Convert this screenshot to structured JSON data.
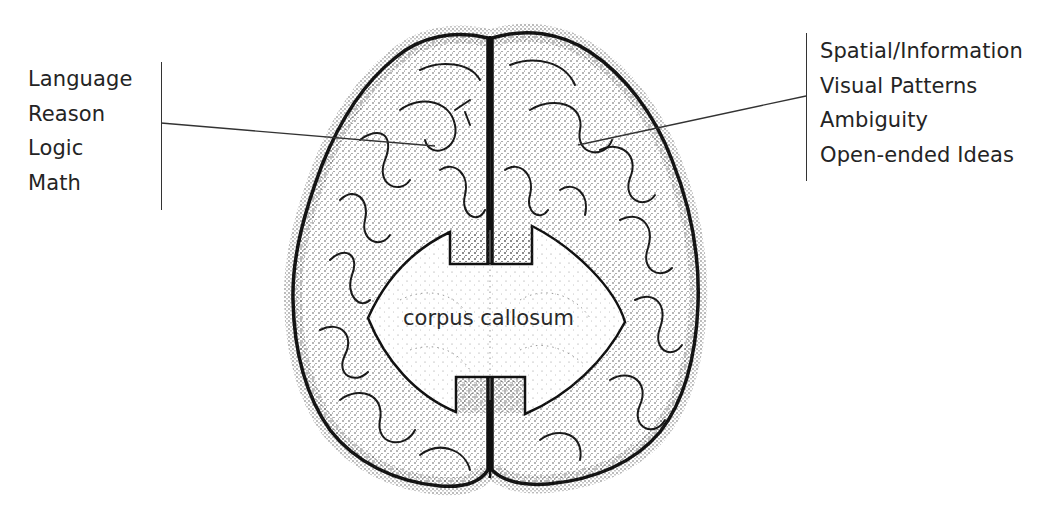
{
  "diagram": {
    "left_hemisphere": {
      "labels": [
        "Language",
        "Reason",
        "Logic",
        "Math"
      ]
    },
    "right_hemisphere": {
      "labels": [
        "Spatial/Information",
        "Visual Patterns",
        "Ambiguity",
        "Open-ended Ideas"
      ]
    },
    "center": {
      "label": "corpus callosum"
    },
    "colors": {
      "ink": "#222222",
      "background": "#ffffff"
    }
  }
}
